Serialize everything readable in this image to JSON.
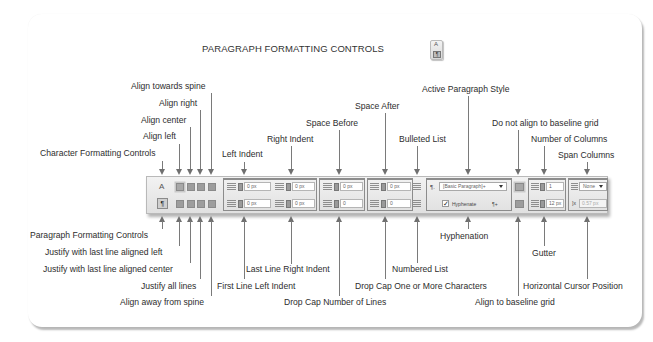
{
  "title": "PARAGRAPH FORMATTING CONTROLS",
  "mode_icon": {
    "top_glyph": "A",
    "bottom_glyph": "¶"
  },
  "top_labels": {
    "character_formatting_controls": "Character Formatting Controls",
    "align_left": "Align left",
    "align_center": "Align center",
    "align_right": "Align right",
    "align_towards_spine": "Align towards spine",
    "left_indent": "Left Indent",
    "right_indent": "Right Indent",
    "space_before": "Space Before",
    "space_after": "Space After",
    "bulleted_list": "Bulleted List",
    "active_paragraph_style": "Active Paragraph Style",
    "do_not_align_baseline": "Do not align to baseline grid",
    "number_of_columns": "Number of Columns",
    "span_columns": "Span Columns"
  },
  "bottom_labels": {
    "paragraph_formatting_controls": "Paragraph Formatting Controls",
    "justify_last_left": "Justify with last line aligned left",
    "justify_last_center": "Justify with last line aligned center",
    "justify_all": "Justify all lines",
    "align_away_spine": "Align away from spine",
    "first_line_left_indent": "First Line Left Indent",
    "last_line_right_indent": "Last Line Right Indent",
    "drop_cap_lines": "Drop Cap Number of Lines",
    "drop_cap_chars": "Drop Cap One or More Characters",
    "numbered_list": "Numbered List",
    "hyphenation": "Hyphenation",
    "align_baseline": "Align to baseline grid",
    "gutter": "Gutter",
    "horizontal_cursor": "Horizontal Cursor Position"
  },
  "toolbar": {
    "char_mode_glyph": "A",
    "para_mode_glyph": "¶",
    "left_indent_value": "0 px",
    "right_indent_value": "0 px",
    "first_line_indent_value": "0 px",
    "last_line_indent_value": "0 px",
    "space_before_value": "0 px",
    "space_after_value": "0 px",
    "drop_cap_lines_value": "0",
    "drop_cap_chars_value": "0",
    "paragraph_style": "[Basic Paragraph]+",
    "hyphenate_label": "Hyphenate",
    "hyphenate_checked": "✓",
    "columns_value": "1",
    "gutter_value": "12 px",
    "span_value": "None",
    "cursor_position": "0.57 px"
  }
}
